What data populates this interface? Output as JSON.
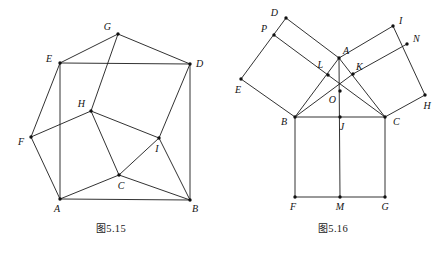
{
  "page": {
    "background": "#ffffff",
    "ink": "#1b1b1b",
    "width": 444,
    "height": 253
  },
  "figures": [
    {
      "id": "fig-5-15",
      "caption_cn": "图",
      "caption_num": "5.15",
      "caption": "图 5.15",
      "vertices": [
        {
          "label": "A",
          "x": 60,
          "y": 199,
          "lx": 57,
          "ly": 212,
          "anchor": "middle"
        },
        {
          "label": "B",
          "x": 190,
          "y": 200,
          "lx": 195,
          "ly": 212,
          "anchor": "middle"
        },
        {
          "label": "C",
          "x": 119,
          "y": 175,
          "lx": 121,
          "ly": 189,
          "anchor": "middle"
        },
        {
          "label": "D",
          "x": 190,
          "y": 64,
          "lx": 196,
          "ly": 67,
          "anchor": "start"
        },
        {
          "label": "E",
          "x": 60,
          "y": 63,
          "lx": 52,
          "ly": 62,
          "anchor": "end"
        },
        {
          "label": "F",
          "x": 31,
          "y": 137,
          "lx": 24,
          "ly": 145,
          "anchor": "end"
        },
        {
          "label": "G",
          "x": 118,
          "y": 34,
          "lx": 111,
          "ly": 30,
          "anchor": "end"
        },
        {
          "label": "H",
          "x": 91,
          "y": 111,
          "lx": 85,
          "ly": 107,
          "anchor": "end"
        },
        {
          "label": "I",
          "x": 159,
          "y": 138,
          "lx": 157,
          "ly": 152,
          "anchor": "middle"
        }
      ],
      "edges": [
        [
          "A",
          "B"
        ],
        [
          "A",
          "C"
        ],
        [
          "A",
          "F"
        ],
        [
          "A",
          "E"
        ],
        [
          "B",
          "C"
        ],
        [
          "B",
          "D"
        ],
        [
          "B",
          "I"
        ],
        [
          "C",
          "H"
        ],
        [
          "C",
          "I"
        ],
        [
          "D",
          "E"
        ],
        [
          "D",
          "G"
        ],
        [
          "D",
          "I"
        ],
        [
          "E",
          "F"
        ],
        [
          "E",
          "G"
        ],
        [
          "F",
          "H"
        ],
        [
          "G",
          "H"
        ],
        [
          "H",
          "I"
        ]
      ]
    },
    {
      "id": "fig-5-16",
      "caption_cn": "图",
      "caption_num": "5.16",
      "caption": "图 5.16",
      "vertices": [
        {
          "label": "A",
          "x": 117,
          "y": 58,
          "lx": 121,
          "ly": 54,
          "anchor": "start"
        },
        {
          "label": "B",
          "x": 73,
          "y": 117,
          "lx": 65,
          "ly": 125,
          "anchor": "end"
        },
        {
          "label": "C",
          "x": 163,
          "y": 117,
          "lx": 171,
          "ly": 125,
          "anchor": "start"
        },
        {
          "label": "D",
          "x": 64,
          "y": 18,
          "lx": 56,
          "ly": 16,
          "anchor": "end"
        },
        {
          "label": "E",
          "x": 19,
          "y": 79,
          "lx": 16,
          "ly": 93,
          "anchor": "middle"
        },
        {
          "label": "F",
          "x": 73,
          "y": 197,
          "lx": 71,
          "ly": 210,
          "anchor": "middle"
        },
        {
          "label": "G",
          "x": 163,
          "y": 197,
          "lx": 163,
          "ly": 210,
          "anchor": "middle"
        },
        {
          "label": "H",
          "x": 203,
          "y": 95,
          "lx": 205,
          "ly": 109,
          "anchor": "middle"
        },
        {
          "label": "I",
          "x": 171,
          "y": 26,
          "lx": 177,
          "ly": 24,
          "anchor": "start"
        },
        {
          "label": "J",
          "x": 118,
          "y": 117,
          "lx": 120,
          "ly": 130,
          "anchor": "middle"
        },
        {
          "label": "K",
          "x": 131,
          "y": 74,
          "lx": 134,
          "ly": 70,
          "anchor": "start"
        },
        {
          "label": "L",
          "x": 106,
          "y": 75,
          "lx": 101,
          "ly": 68,
          "anchor": "end"
        },
        {
          "label": "M",
          "x": 118,
          "y": 197,
          "lx": 118,
          "ly": 210,
          "anchor": "middle"
        },
        {
          "label": "N",
          "x": 185,
          "y": 44,
          "lx": 191,
          "ly": 42,
          "anchor": "start"
        },
        {
          "label": "O",
          "x": 118,
          "y": 91,
          "lx": 114,
          "ly": 103,
          "anchor": "end"
        },
        {
          "label": "P",
          "x": 52,
          "y": 35,
          "lx": 45,
          "ly": 32,
          "anchor": "end"
        }
      ],
      "edges": [
        [
          "A",
          "B"
        ],
        [
          "A",
          "C"
        ],
        [
          "A",
          "D"
        ],
        [
          "A",
          "I"
        ],
        [
          "A",
          "M"
        ],
        [
          "B",
          "C"
        ],
        [
          "B",
          "E"
        ],
        [
          "B",
          "F"
        ],
        [
          "B",
          "K"
        ],
        [
          "C",
          "G"
        ],
        [
          "C",
          "H"
        ],
        [
          "C",
          "L"
        ],
        [
          "D",
          "E"
        ],
        [
          "I",
          "H"
        ],
        [
          "F",
          "G"
        ],
        [
          "P",
          "L"
        ],
        [
          "N",
          "K"
        ]
      ]
    }
  ]
}
